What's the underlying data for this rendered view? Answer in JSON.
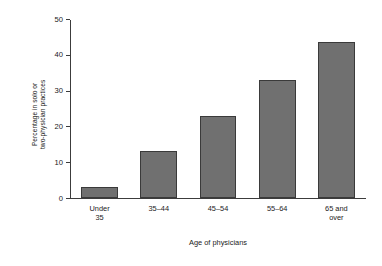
{
  "chart_data": {
    "type": "bar",
    "title": "",
    "xlabel": "Age of physicians",
    "ylabel": "Percentage in solo or two-physician practices",
    "ylabel_lines": [
      "Percentage in solo or",
      "two-physician practices"
    ],
    "categories": [
      "Under 35",
      "35–44",
      "45–54",
      "55–64",
      "65 and over"
    ],
    "category_lines": [
      [
        "Under",
        "35"
      ],
      [
        "35–44"
      ],
      [
        "45–54"
      ],
      [
        "55–64"
      ],
      [
        "65 and",
        "over"
      ]
    ],
    "values": [
      3,
      13,
      23,
      33,
      43.5
    ],
    "ylim": [
      0,
      50
    ],
    "yticks": [
      0,
      10,
      20,
      30,
      40,
      50
    ],
    "ytick_labels": [
      "0",
      "10",
      "20",
      "30",
      "40",
      "50"
    ],
    "grid": false,
    "legend": null,
    "bar_color": "#707070",
    "bar_edge_color": "#3a3a3a",
    "axis_color": "#3c3c3c",
    "background": "#ffffff"
  }
}
